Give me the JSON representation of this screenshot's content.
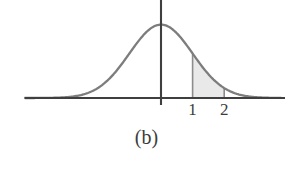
{
  "figure": {
    "caption": "(b)",
    "background_color": "#ffffff"
  },
  "chart_data": {
    "type": "area",
    "title": "",
    "subtitle": "",
    "xlabel": "",
    "ylabel": "",
    "curve": {
      "name": "standard normal density",
      "mean": 0,
      "std_dev": 1,
      "stroke_color": "#7d7d7d",
      "stroke_width": 2.2
    },
    "shaded_region": {
      "label": "area between 1 and 2",
      "x_start": 1,
      "x_end": 2,
      "fill_color": "#e9e9e9",
      "boundary_color": "#8c8c8c"
    },
    "x_ticks": [
      {
        "value": 1,
        "label": "1"
      },
      {
        "value": 2,
        "label": "2"
      }
    ],
    "y_ticks": [],
    "axes": {
      "x_axis_visible": true,
      "y_axis_visible": true,
      "axis_color": "#3f3f3f",
      "xlim": [
        -5.2,
        4.8
      ],
      "ylim": [
        0,
        1.12
      ]
    },
    "grid": false,
    "legend": null
  },
  "colors": {
    "curve": "#7d7d7d",
    "fill": "#e9e9e9",
    "axis": "#3f3f3f",
    "text": "#3c3c3c"
  }
}
